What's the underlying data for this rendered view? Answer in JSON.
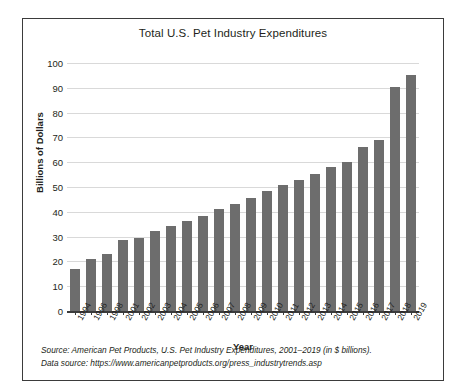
{
  "figure": {
    "title": "Total U.S. Pet Industry Expenditures",
    "x_axis_title": "Year",
    "y_axis_title": "Billions of Dollars",
    "source_line_1": "Source: American Pet Products, U.S. Pet Industry Expenditures, 2001–2019 (in $ billions).",
    "source_line_2": "Data source: https://www.americanpetproducts.org/press_industrytrends.asp",
    "bar_color": "#6d6d6d",
    "gridline_color": "#d9d9d9",
    "axis_color": "#3b3b3b",
    "border_color": "#3b3b3b",
    "background": "#ffffff"
  },
  "chart_data": {
    "type": "bar",
    "title": "Total U.S. Pet Industry Expenditures",
    "xlabel": "Year",
    "ylabel": "Billions of Dollars",
    "ylim": [
      0,
      100
    ],
    "ytick_step": 10,
    "yticks": [
      0,
      10,
      20,
      30,
      40,
      50,
      60,
      70,
      80,
      90,
      100
    ],
    "grid": true,
    "legend": false,
    "units": "$ billions",
    "categories": [
      "1994",
      "1996",
      "1998",
      "2001",
      "2002",
      "2003",
      "2004",
      "2005",
      "2006",
      "2007",
      "2008",
      "2009",
      "2010",
      "2011",
      "2012",
      "2013",
      "2014",
      "2015",
      "2016",
      "2017",
      "2018",
      "2019"
    ],
    "values": [
      17.0,
      21.0,
      23.0,
      28.5,
      29.5,
      32.4,
      34.4,
      36.3,
      38.5,
      41.2,
      43.2,
      45.5,
      48.4,
      50.8,
      53.0,
      55.2,
      58.0,
      60.0,
      66.3,
      69.0,
      90.5,
      95.2
    ]
  }
}
